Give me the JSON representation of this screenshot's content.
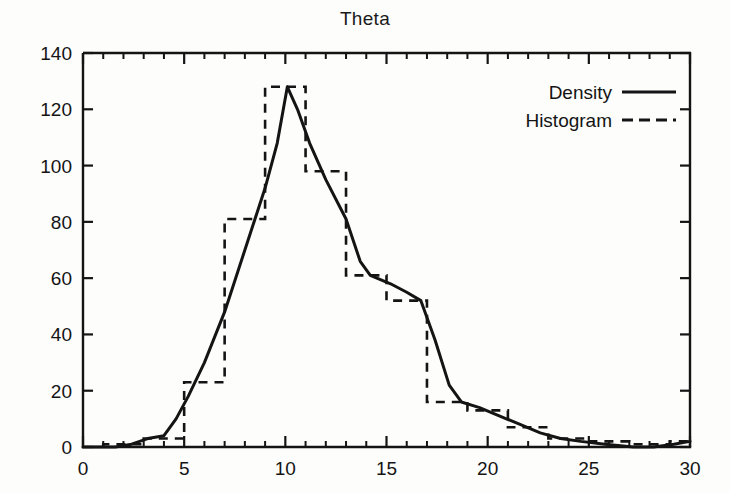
{
  "chart_data": {
    "type": "bar",
    "title": "Theta",
    "xlabel": "",
    "ylabel": "",
    "xlim": [
      0,
      30
    ],
    "ylim": [
      0,
      140
    ],
    "xticks": [
      0,
      5,
      10,
      15,
      20,
      25,
      30
    ],
    "xtick_labels": [
      "0",
      "5",
      "10",
      "15",
      "20",
      "25",
      "30"
    ],
    "x_minor_tick_step": 1,
    "yticks": [
      0,
      20,
      40,
      60,
      80,
      100,
      120,
      140
    ],
    "ytick_labels": [
      "0",
      "20",
      "40",
      "60",
      "80",
      "100",
      "120",
      "140"
    ],
    "grid": false,
    "legend_position": "upper right",
    "legend": [
      {
        "name": "Density",
        "style": "solid"
      },
      {
        "name": "Histogram",
        "style": "dashed"
      }
    ],
    "series": [
      {
        "name": "Histogram",
        "type": "bar",
        "style": "dashed",
        "bin_width": 2,
        "bins": [
          {
            "x0": 1,
            "x1": 3,
            "value": 1
          },
          {
            "x0": 3,
            "x1": 5,
            "value": 3
          },
          {
            "x0": 5,
            "x1": 7,
            "value": 23
          },
          {
            "x0": 7,
            "x1": 9,
            "value": 81
          },
          {
            "x0": 9,
            "x1": 11,
            "value": 128
          },
          {
            "x0": 11,
            "x1": 13,
            "value": 98
          },
          {
            "x0": 13,
            "x1": 15,
            "value": 61
          },
          {
            "x0": 15,
            "x1": 17,
            "value": 52
          },
          {
            "x0": 17,
            "x1": 19,
            "value": 16
          },
          {
            "x0": 19,
            "x1": 21,
            "value": 13
          },
          {
            "x0": 21,
            "x1": 23,
            "value": 7
          },
          {
            "x0": 23,
            "x1": 25,
            "value": 3
          },
          {
            "x0": 25,
            "x1": 27,
            "value": 2
          },
          {
            "x0": 27,
            "x1": 29,
            "value": 1
          },
          {
            "x0": 29,
            "x1": 30,
            "value": 2
          }
        ]
      },
      {
        "name": "Density",
        "type": "line",
        "style": "solid",
        "points": [
          {
            "x": 0,
            "y": 0
          },
          {
            "x": 1.6,
            "y": 0
          },
          {
            "x": 2.4,
            "y": 1
          },
          {
            "x": 3.2,
            "y": 3
          },
          {
            "x": 4.0,
            "y": 4
          },
          {
            "x": 4.6,
            "y": 10
          },
          {
            "x": 5.2,
            "y": 18
          },
          {
            "x": 6.0,
            "y": 30
          },
          {
            "x": 7.0,
            "y": 48
          },
          {
            "x": 8.0,
            "y": 70
          },
          {
            "x": 9.0,
            "y": 92
          },
          {
            "x": 9.6,
            "y": 108
          },
          {
            "x": 10.1,
            "y": 128
          },
          {
            "x": 10.6,
            "y": 120
          },
          {
            "x": 11.2,
            "y": 108
          },
          {
            "x": 12.0,
            "y": 95
          },
          {
            "x": 13.0,
            "y": 81
          },
          {
            "x": 13.7,
            "y": 66
          },
          {
            "x": 14.2,
            "y": 61
          },
          {
            "x": 15.2,
            "y": 58
          },
          {
            "x": 16.0,
            "y": 55
          },
          {
            "x": 16.7,
            "y": 52
          },
          {
            "x": 17.4,
            "y": 38
          },
          {
            "x": 18.1,
            "y": 22
          },
          {
            "x": 18.7,
            "y": 16
          },
          {
            "x": 19.6,
            "y": 14
          },
          {
            "x": 20.6,
            "y": 11
          },
          {
            "x": 21.6,
            "y": 8
          },
          {
            "x": 22.6,
            "y": 5
          },
          {
            "x": 23.6,
            "y": 3
          },
          {
            "x": 24.6,
            "y": 2
          },
          {
            "x": 25.8,
            "y": 1
          },
          {
            "x": 27.2,
            "y": 0
          },
          {
            "x": 28.2,
            "y": 0
          },
          {
            "x": 29.2,
            "y": 1
          },
          {
            "x": 30,
            "y": 2
          }
        ]
      }
    ]
  },
  "colors": {
    "ink": "#141414",
    "background": "#fdfdfc"
  }
}
